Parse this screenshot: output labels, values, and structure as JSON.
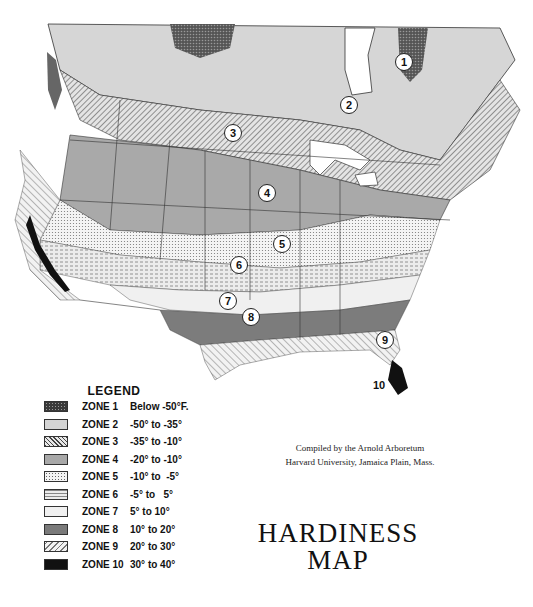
{
  "map": {
    "zone_labels": [
      {
        "text": "1",
        "x": 403,
        "y": 61
      },
      {
        "text": "2",
        "x": 348,
        "y": 104
      },
      {
        "text": "3",
        "x": 232,
        "y": 132
      },
      {
        "text": "4",
        "x": 266,
        "y": 192
      },
      {
        "text": "5",
        "x": 281,
        "y": 243
      },
      {
        "text": "6",
        "x": 238,
        "y": 264
      },
      {
        "text": "7",
        "x": 227,
        "y": 300
      },
      {
        "text": "8",
        "x": 250,
        "y": 316
      },
      {
        "text": "9",
        "x": 384,
        "y": 339
      },
      {
        "text": "10",
        "x": 379,
        "y": 385
      }
    ]
  },
  "legend": {
    "title": "LEGEND",
    "items": [
      {
        "zone": "ZONE 1",
        "range": "Below -50°F.",
        "pattern": "crosshatch-dark",
        "color": "#3a3a3a"
      },
      {
        "zone": "ZONE 2",
        "range": "-50° to -35°",
        "pattern": "light-stipple",
        "color": "#d4d4d4"
      },
      {
        "zone": "ZONE 3",
        "range": "-35° to -10°",
        "pattern": "diagonal-hatch",
        "color": "#bdbdbd"
      },
      {
        "zone": "ZONE 4",
        "range": "-20° to -10°",
        "pattern": "medium-gray",
        "color": "#a8a8a8"
      },
      {
        "zone": "ZONE 5",
        "range": "-10° to  -5°",
        "pattern": "dotted",
        "color": "#e6e6e6"
      },
      {
        "zone": "ZONE 6",
        "range": "-5° to   5°",
        "pattern": "dash-dotted",
        "color": "#dcdcdc"
      },
      {
        "zone": "ZONE 7",
        "range": "5° to 10°",
        "pattern": "fine-dots",
        "color": "#f0f0f0"
      },
      {
        "zone": "ZONE 8",
        "range": "10° to 20°",
        "pattern": "dark-gray",
        "color": "#7a7a7a"
      },
      {
        "zone": "ZONE 9",
        "range": "20° to 30°",
        "pattern": "reverse-hatch",
        "color": "#d0d0d0"
      },
      {
        "zone": "ZONE 10",
        "range": "30° to 40°",
        "pattern": "solid-black",
        "color": "#111111"
      }
    ]
  },
  "credit": {
    "line1": "Compiled by the Arnold Arboretum",
    "line2": "Harvard University, Jamaica Plain, Mass."
  },
  "title": {
    "line1": "HARDINESS",
    "line2": "MAP"
  }
}
